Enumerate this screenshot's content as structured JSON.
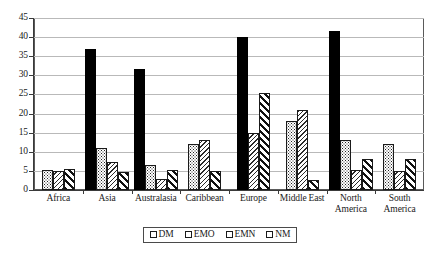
{
  "chart_data": {
    "type": "bar",
    "title": "",
    "subtitle": "",
    "xlabel": "",
    "ylabel": "",
    "ylim": [
      0,
      45
    ],
    "ytick_step": 5,
    "yticks": [
      45,
      40,
      35,
      30,
      25,
      20,
      15,
      10,
      5,
      0
    ],
    "grid": true,
    "legend_position": "bottom",
    "categories": [
      "Africa",
      "Asia",
      "Australasia",
      "Caribbean",
      "Europe",
      "Middle East",
      "North America",
      "South America"
    ],
    "series": [
      {
        "name": "DM",
        "pattern": "solid-black",
        "values": [
          0,
          36.8,
          31.6,
          0,
          40.0,
          0,
          41.5,
          0
        ]
      },
      {
        "name": "EMO",
        "pattern": "dotted-stipple",
        "values": [
          5.3,
          11.0,
          6.5,
          12.0,
          0,
          18.0,
          13.0,
          12.0
        ]
      },
      {
        "name": "EMN",
        "pattern": "light-diagonal-up",
        "values": [
          5.1,
          7.4,
          3.0,
          13.0,
          15.0,
          21.0,
          5.2,
          5.0
        ]
      },
      {
        "name": "NM",
        "pattern": "bold-diagonal-down",
        "values": [
          5.4,
          4.6,
          5.2,
          4.9,
          25.5,
          2.6,
          8.2,
          8.0
        ]
      }
    ]
  },
  "legend": {
    "items": [
      {
        "label": "DM"
      },
      {
        "label": "EMO"
      },
      {
        "label": "EMN"
      },
      {
        "label": "NM"
      }
    ]
  },
  "colors": {
    "dm": "#000000",
    "axis": "#3a3a3a",
    "grid": "#b9b9b9",
    "background": "#ffffff"
  }
}
